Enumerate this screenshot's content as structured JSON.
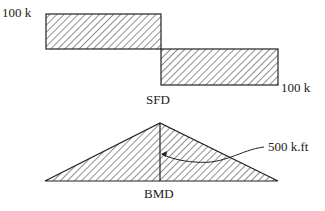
{
  "sfd": {
    "title": "SFD",
    "left_label": "100 k",
    "right_label": "100 k"
  },
  "bmd": {
    "title": "BMD",
    "max_label": "500 k.ft"
  }
}
